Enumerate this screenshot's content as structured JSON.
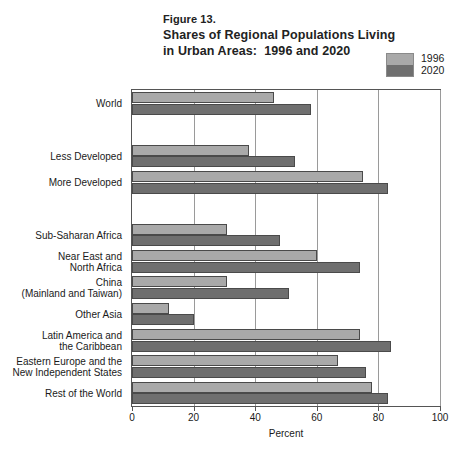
{
  "figure": {
    "number": "Figure 13.",
    "title_line1": "Shares of Regional Populations Living",
    "title_line2": "in Urban Areas:  1996 and 2020"
  },
  "legend": {
    "position": "top-right",
    "entries": [
      {
        "label": "1996",
        "color": "#a9a9a9"
      },
      {
        "label": "2020",
        "color": "#6f6f6f"
      }
    ]
  },
  "axis": {
    "x_title": "Percent",
    "x_ticks": [
      "0",
      "20",
      "40",
      "60",
      "80",
      "100"
    ]
  },
  "chart_data": {
    "type": "bar",
    "orientation": "horizontal",
    "title": "Shares of Regional Populations Living in Urban Areas:  1996 and 2020",
    "xlabel": "Percent",
    "ylabel": "",
    "xlim": [
      0,
      100
    ],
    "grid": true,
    "legend_position": "top-right",
    "categories": [
      "World",
      "Less Developed",
      "More Developed",
      "Sub-Saharan Africa",
      "Near East and\nNorth Africa",
      "China\n(Mainland and Taiwan)",
      "Other Asia",
      "Latin America and\nthe Caribbean",
      "Eastern Europe and the\nNew Independent States",
      "Rest of the World"
    ],
    "series": [
      {
        "name": "1996",
        "color": "#a9a9a9",
        "values": [
          46,
          38,
          75,
          31,
          60,
          31,
          12,
          74,
          67,
          78
        ]
      },
      {
        "name": "2020",
        "color": "#6f6f6f",
        "values": [
          58,
          53,
          83,
          48,
          74,
          51,
          20,
          84,
          76,
          83
        ]
      }
    ]
  }
}
